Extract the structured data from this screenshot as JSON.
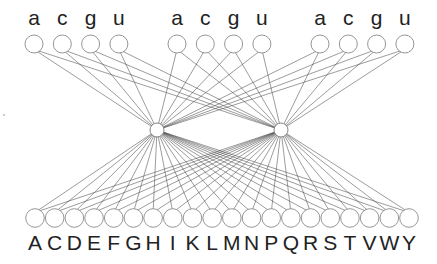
{
  "diagram": {
    "type": "bipartite-neural-network",
    "colors": {
      "edge": "#4a4a4a",
      "node_stroke": "#8a8a8a",
      "node_fill": "#ffffff",
      "text": "#222222"
    },
    "top_layer": {
      "groups": [
        {
          "labels": [
            "a",
            "c",
            "g",
            "u"
          ]
        },
        {
          "labels": [
            "a",
            "c",
            "g",
            "u"
          ]
        },
        {
          "labels": [
            "a",
            "c",
            "g",
            "u"
          ]
        }
      ]
    },
    "hidden_layer": {
      "count": 2
    },
    "bottom_layer": {
      "labels": [
        "A",
        "C",
        "D",
        "E",
        "F",
        "G",
        "H",
        "I",
        "K",
        "L",
        "M",
        "N",
        "P",
        "Q",
        "R",
        "S",
        "T",
        "V",
        "W",
        "Y"
      ]
    }
  }
}
